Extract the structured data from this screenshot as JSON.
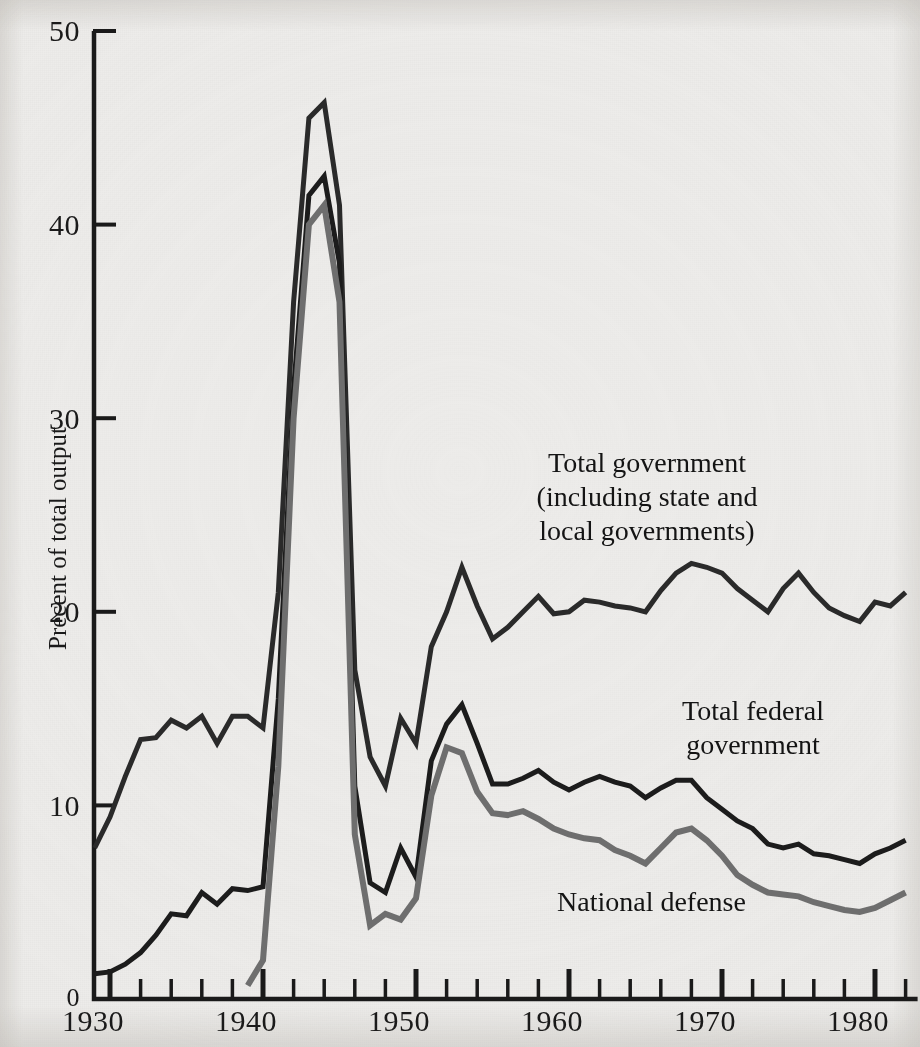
{
  "figure": {
    "background_color": "#edecea",
    "ink_color": "#1a1a1a"
  },
  "axes": {
    "y_axis_title": "Precent of total output",
    "y_ticks": [
      "0",
      "10",
      "20",
      "30",
      "40",
      "50"
    ],
    "x_ticks": [
      "1930",
      "1940",
      "1950",
      "1960",
      "1970",
      "1980"
    ]
  },
  "annotations": {
    "total_government": "Total government\n(including state and\nlocal governments)",
    "total_federal": "Total federal\ngovernment",
    "national_defense": "National defense"
  },
  "chart_data": {
    "type": "line",
    "title": "",
    "xlabel": "",
    "ylabel": "Precent of total output",
    "xlim": [
      1929,
      1982
    ],
    "ylim": [
      0,
      50
    ],
    "grid": false,
    "legend": "inline-annotations",
    "x_tick_values": [
      1930,
      1940,
      1950,
      1960,
      1970,
      1980
    ],
    "x_minor_tick_interval": 2,
    "y_tick_values": [
      0,
      10,
      20,
      30,
      40,
      50
    ],
    "series": [
      {
        "name": "Total government (including state and local governments)",
        "color": "#2a2a2a",
        "width": 5,
        "x": [
          1929,
          1930,
          1931,
          1932,
          1933,
          1934,
          1935,
          1936,
          1937,
          1938,
          1939,
          1940,
          1941,
          1942,
          1943,
          1944,
          1945,
          1946,
          1947,
          1948,
          1949,
          1950,
          1951,
          1952,
          1953,
          1954,
          1955,
          1956,
          1957,
          1958,
          1959,
          1960,
          1961,
          1962,
          1963,
          1964,
          1965,
          1966,
          1967,
          1968,
          1969,
          1970,
          1971,
          1972,
          1973,
          1974,
          1975,
          1976,
          1977,
          1978,
          1979,
          1980,
          1981,
          1982
        ],
        "values": [
          7.8,
          9.4,
          11.5,
          13.4,
          13.5,
          14.4,
          14.0,
          14.6,
          13.2,
          14.6,
          14.6,
          14.0,
          21.0,
          36.0,
          45.5,
          46.3,
          41.0,
          17.0,
          12.5,
          11.0,
          14.5,
          13.2,
          18.2,
          20.0,
          22.3,
          20.3,
          18.6,
          19.2,
          20.0,
          20.8,
          19.9,
          20.0,
          20.6,
          20.5,
          20.3,
          20.2,
          20.0,
          21.1,
          22.0,
          22.5,
          22.3,
          22.0,
          21.2,
          20.6,
          20.0,
          21.2,
          22.0,
          21.0,
          20.2,
          19.8,
          19.5,
          20.5,
          20.3,
          21.0
        ]
      },
      {
        "name": "Total federal government",
        "color": "#1c1c1c",
        "width": 5,
        "x": [
          1929,
          1930,
          1931,
          1932,
          1933,
          1934,
          1935,
          1936,
          1937,
          1938,
          1939,
          1940,
          1941,
          1942,
          1943,
          1944,
          1945,
          1946,
          1947,
          1948,
          1949,
          1950,
          1951,
          1952,
          1953,
          1954,
          1955,
          1956,
          1957,
          1958,
          1959,
          1960,
          1961,
          1962,
          1963,
          1964,
          1965,
          1966,
          1967,
          1968,
          1969,
          1970,
          1971,
          1972,
          1973,
          1974,
          1975,
          1976,
          1977,
          1978,
          1979,
          1980,
          1981,
          1982
        ],
        "values": [
          1.3,
          1.4,
          1.8,
          2.4,
          3.3,
          4.4,
          4.3,
          5.5,
          4.9,
          5.7,
          5.6,
          5.8,
          15.5,
          31.5,
          41.5,
          42.5,
          38.0,
          11.0,
          6.0,
          5.5,
          7.8,
          6.3,
          12.3,
          14.2,
          15.2,
          13.2,
          11.1,
          11.1,
          11.4,
          11.8,
          11.2,
          10.8,
          11.2,
          11.5,
          11.2,
          11.0,
          10.4,
          10.9,
          11.3,
          11.3,
          10.4,
          9.8,
          9.2,
          8.8,
          8.0,
          7.8,
          8.0,
          7.5,
          7.4,
          7.2,
          7.0,
          7.5,
          7.8,
          8.2
        ]
      },
      {
        "name": "National defense",
        "color": "#6e6e6e",
        "width": 6,
        "x": [
          1939,
          1940,
          1941,
          1942,
          1943,
          1944,
          1945,
          1946,
          1947,
          1948,
          1949,
          1950,
          1951,
          1952,
          1953,
          1954,
          1955,
          1956,
          1957,
          1958,
          1959,
          1960,
          1961,
          1962,
          1963,
          1964,
          1965,
          1966,
          1967,
          1968,
          1969,
          1970,
          1971,
          1972,
          1973,
          1974,
          1975,
          1976,
          1977,
          1978,
          1979,
          1980,
          1981,
          1982
        ],
        "values": [
          0.7,
          2.0,
          12.0,
          30.0,
          40.0,
          41.0,
          36.0,
          8.5,
          3.8,
          4.4,
          4.1,
          5.2,
          10.5,
          13.0,
          12.7,
          10.7,
          9.6,
          9.5,
          9.7,
          9.3,
          8.8,
          8.5,
          8.3,
          8.2,
          7.7,
          7.4,
          7.0,
          7.8,
          8.6,
          8.8,
          8.2,
          7.4,
          6.4,
          5.9,
          5.5,
          5.4,
          5.3,
          5.0,
          4.8,
          4.6,
          4.5,
          4.7,
          5.1,
          5.5
        ]
      }
    ]
  }
}
